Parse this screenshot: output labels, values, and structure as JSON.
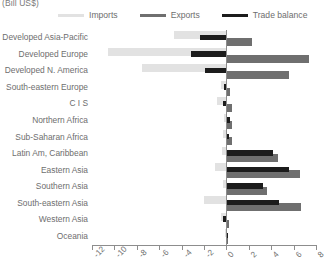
{
  "unit_label": "(Bill US$)",
  "legend": {
    "items": [
      {
        "label": "Imports",
        "color": "#e2e2e2",
        "name": "legend-imports"
      },
      {
        "label": "Exports",
        "color": "#6f6f6f",
        "name": "legend-exports"
      },
      {
        "label": "Trade balance",
        "color": "#1c1c1c",
        "name": "legend-trade-balance"
      }
    ]
  },
  "chart_data": {
    "type": "bar",
    "orientation": "horizontal",
    "title": "",
    "subtitle": "",
    "xlabel": "(Bill US$)",
    "ylabel": "",
    "xlim": [
      -12,
      8
    ],
    "xticks": [
      -12,
      -10,
      -8,
      -6,
      -4,
      -2,
      0,
      2,
      4,
      6,
      8
    ],
    "xtick_labels": [
      "-12",
      "-10",
      "-8",
      "-6",
      "-4",
      "-2",
      "0",
      "2",
      "4",
      "6",
      "8"
    ],
    "grid": false,
    "legend_position": "top",
    "categories": [
      "Developed Asia-Pacific",
      "Developed Europe",
      "Developed N. America",
      "South-eastern Europe",
      "C I S",
      "Northern Africa",
      "Sub-Saharan Africa",
      "Latin Am, Caribbean",
      "Eastern Asia",
      "Southern Asia",
      "South-eastern Asia",
      "Western Asia",
      "Oceania"
    ],
    "series": [
      {
        "name": "Imports",
        "color": "#e2e2e2",
        "values": [
          -4.7,
          -10.6,
          -7.5,
          -0.5,
          -0.8,
          -0.2,
          -0.3,
          -0.4,
          -1.0,
          -0.3,
          -2.0,
          -0.5,
          -0.1
        ]
      },
      {
        "name": "Exports",
        "color": "#6f6f6f",
        "values": [
          2.3,
          7.4,
          5.6,
          0.3,
          0.5,
          0.5,
          0.5,
          4.6,
          6.6,
          3.6,
          6.7,
          0.2,
          0.1
        ]
      },
      {
        "name": "Trade balance",
        "color": "#1c1c1c",
        "values": [
          -2.4,
          -3.2,
          -1.9,
          -0.2,
          -0.3,
          0.3,
          0.2,
          4.2,
          5.6,
          3.3,
          4.7,
          -0.3,
          0.0
        ]
      }
    ]
  }
}
